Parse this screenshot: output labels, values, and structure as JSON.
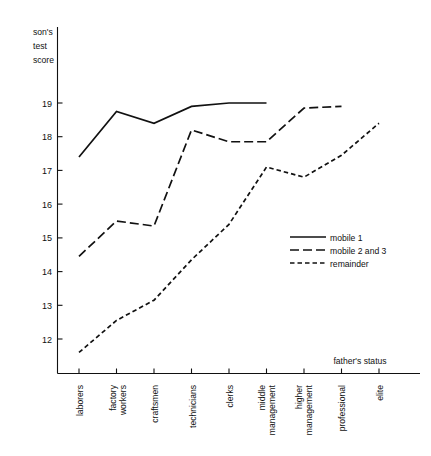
{
  "chart_data": {
    "type": "line",
    "title": "",
    "ylabel": "son's test score",
    "ylabel_lines": [
      "son's",
      "test",
      "score"
    ],
    "xlabel": "father's status",
    "categories": [
      "laborers",
      "factory workers",
      "craftsmen",
      "technicians",
      "clerks",
      "middle management",
      "higher management",
      "professional",
      "elite"
    ],
    "category_lines": [
      [
        "laborers"
      ],
      [
        "factory",
        "workers"
      ],
      [
        "craftsmen"
      ],
      [
        "technicians"
      ],
      [
        "clerks"
      ],
      [
        "middle",
        "management"
      ],
      [
        "higher",
        "management"
      ],
      [
        "professional"
      ],
      [
        "elite"
      ]
    ],
    "yticks": [
      12,
      13,
      14,
      15,
      16,
      17,
      18,
      19
    ],
    "ytick_labels": [
      "12",
      "13",
      "14",
      "15",
      "16",
      "17",
      "18",
      "19"
    ],
    "ylim": [
      11.3,
      19.45
    ],
    "xlim": [
      0,
      8
    ],
    "grid": false,
    "legend_position": "center-right",
    "series": [
      {
        "name": "mobile 1",
        "style": "solid",
        "dasharray": "",
        "x": [
          "laborers",
          "factory workers",
          "craftsmen",
          "technicians",
          "clerks",
          "middle management"
        ],
        "values": [
          17.4,
          18.75,
          18.4,
          18.9,
          19.0,
          19.0
        ]
      },
      {
        "name": "mobile 2 and 3",
        "style": "long-dash",
        "dasharray": "9,4",
        "x": [
          "laborers",
          "factory workers",
          "craftsmen",
          "technicians",
          "clerks",
          "middle management",
          "higher management",
          "professional"
        ],
        "values": [
          14.45,
          15.5,
          15.35,
          18.2,
          17.85,
          17.85,
          18.85,
          18.9
        ]
      },
      {
        "name": "remainder",
        "style": "short-dash",
        "dasharray": "4.5,3",
        "x": [
          "laborers",
          "factory workers",
          "craftsmen",
          "technicians",
          "clerks",
          "middle management",
          "higher management",
          "professional",
          "elite"
        ],
        "values": [
          11.6,
          12.55,
          13.15,
          14.35,
          15.4,
          17.1,
          16.8,
          17.45,
          18.4
        ]
      }
    ],
    "colors": {
      "axis": "#111111",
      "series": "#111111",
      "background": "#ffffff"
    }
  }
}
